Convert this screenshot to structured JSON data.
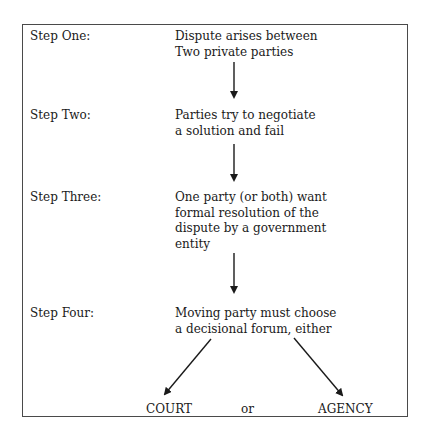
{
  "diagram": {
    "steps": [
      {
        "label": "Step One:",
        "text": "Dispute arises between\nTwo private parties"
      },
      {
        "label": "Step Two:",
        "text": "Parties try to negotiate\na solution and fail"
      },
      {
        "label": "Step Three:",
        "text": "One party (or both) want\nformal resolution of the\ndispute by a government\nentity"
      },
      {
        "label": "Step Four:",
        "text": "Moving party must choose\na decisional forum, either"
      }
    ],
    "outcomes": {
      "left": "COURT",
      "connector": "or",
      "right": "AGENCY"
    },
    "colors": {
      "line": "#1a1a1a",
      "border": "#4a4a4a"
    }
  }
}
